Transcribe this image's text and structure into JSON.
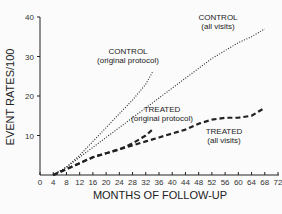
{
  "chart_data": {
    "type": "line",
    "title": "",
    "xlabel": "MONTHS OF FOLLOW-UP",
    "ylabel": "EVENT RATES/100",
    "xlim": [
      0,
      72
    ],
    "ylim": [
      0,
      40
    ],
    "x_ticks": [
      "0",
      "4",
      "8",
      "12",
      "16",
      "20",
      "24",
      "28",
      "32",
      "36",
      "40",
      "44",
      "48",
      "52",
      "56",
      "60",
      "64",
      "68",
      "72"
    ],
    "y_ticks": [
      "10",
      "20",
      "30",
      "40"
    ],
    "grid": false,
    "legend": "inline annotations",
    "series": [
      {
        "name": "CONTROL (original protocol)",
        "style": "dotted",
        "x": [
          4,
          8,
          12,
          16,
          20,
          24,
          28,
          32,
          34
        ],
        "y": [
          0,
          2,
          5,
          8.5,
          12,
          15.5,
          19,
          23,
          26
        ]
      },
      {
        "name": "CONTROL (all visits)",
        "style": "dotted",
        "x": [
          4,
          8,
          12,
          16,
          20,
          24,
          28,
          32,
          36,
          40,
          44,
          48,
          52,
          56,
          60,
          64,
          68
        ],
        "y": [
          0,
          2,
          4.5,
          7,
          9.5,
          12,
          14.5,
          17,
          19.5,
          22,
          24.5,
          27,
          29.5,
          31.5,
          33.5,
          35,
          37
        ]
      },
      {
        "name": "TREATED (original protocol)",
        "style": "dashed",
        "x": [
          4,
          8,
          12,
          16,
          20,
          24,
          28,
          32,
          34
        ],
        "y": [
          0,
          1.5,
          3,
          4.5,
          5.5,
          6.5,
          8,
          10,
          11.5
        ]
      },
      {
        "name": "TREATED (all visits)",
        "style": "dashed",
        "x": [
          4,
          8,
          12,
          16,
          20,
          24,
          28,
          32,
          36,
          40,
          44,
          48,
          52,
          56,
          60,
          64,
          68
        ],
        "y": [
          0,
          1.5,
          3,
          4.5,
          5.5,
          6.5,
          7.5,
          8.5,
          9.5,
          10.5,
          11.5,
          13,
          14,
          14.5,
          14.5,
          15,
          17
        ]
      }
    ],
    "annotations": [
      {
        "text": [
          "CONTROL",
          "(original protocol)"
        ],
        "x": 26,
        "y": 33
      },
      {
        "text": [
          "CONTROL",
          "(all visits)"
        ],
        "x": 62,
        "y": 38.5
      },
      {
        "text": [
          "TREATED",
          "(original protocol)"
        ],
        "x": 34,
        "y": 16
      },
      {
        "text": [
          "TREATED",
          "(all visits)"
        ],
        "x": 55,
        "y": 10
      }
    ]
  },
  "labels": {
    "ylabel": "EVENT RATES/100",
    "xlabel": "MONTHS OF FOLLOW-UP",
    "ann_control_orig_1": "CONTROL",
    "ann_control_orig_2": "(original protocol)",
    "ann_control_all_1": "CONTROL",
    "ann_control_all_2": "(all visits)",
    "ann_treated_orig_1": "TREATED",
    "ann_treated_orig_2": "(original protocol)",
    "ann_treated_all_1": "TREATED",
    "ann_treated_all_2": "(all visits)"
  }
}
